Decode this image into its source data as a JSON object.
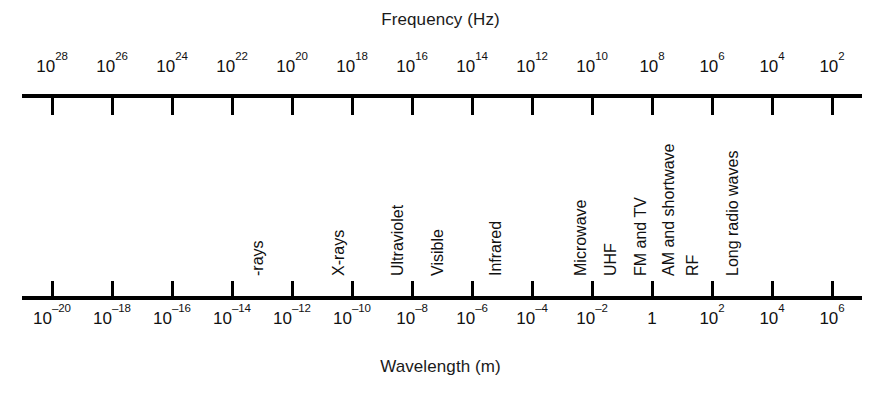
{
  "figure": {
    "name": "electromagnetic-spectrum-chart",
    "top_axis_title": "Frequency (Hz)",
    "bottom_axis_title": "Wavelength (m)",
    "line_color": "#000000",
    "text_color": "#111111",
    "background_color": "#ffffff"
  },
  "chart_data": {
    "type": "line",
    "xlabel": "Wavelength (m)",
    "ylabel": "",
    "top_axis": {
      "label": "Frequency (Hz)",
      "unit": "Hz",
      "direction": "decreasing left-to-right",
      "exponents": [
        28,
        26,
        24,
        22,
        20,
        18,
        16,
        14,
        12,
        10,
        8,
        6,
        4,
        2
      ],
      "tick_labels": [
        "10^28",
        "10^26",
        "10^24",
        "10^22",
        "10^20",
        "10^18",
        "10^16",
        "10^14",
        "10^12",
        "10^10",
        "10^8",
        "10^6",
        "10^4",
        "10^2"
      ]
    },
    "bottom_axis": {
      "label": "Wavelength (m)",
      "unit": "m",
      "direction": "increasing left-to-right",
      "exponents": [
        -20,
        -18,
        -16,
        -14,
        -12,
        -10,
        -8,
        -6,
        -4,
        -2,
        0,
        2,
        4,
        6
      ],
      "tick_labels": [
        "10^-20",
        "10^-18",
        "10^-16",
        "10^-14",
        "10^-12",
        "10^-10",
        "10^-8",
        "10^-6",
        "10^-4",
        "10^-2",
        "1",
        "10^2",
        "10^4",
        "10^6"
      ]
    },
    "bands": [
      {
        "label": "-rays",
        "wavelength_exponent": -16.5
      },
      {
        "label": "X-rays",
        "wavelength_exponent": -10.8
      },
      {
        "label": "Ultraviolet",
        "wavelength_exponent": -8.8
      },
      {
        "label": "Visible",
        "wavelength_exponent": -7.5
      },
      {
        "label": "Infrared",
        "wavelength_exponent": -5.5
      },
      {
        "label": "Microwave",
        "wavelength_exponent": -2.6
      },
      {
        "label": "UHF",
        "wavelength_exponent": -1.6
      },
      {
        "label": "FM and TV",
        "wavelength_exponent": -0.6
      },
      {
        "label": "AM and shortwave",
        "wavelength_exponent": 0.3
      },
      {
        "label": "RF",
        "wavelength_exponent": 1.1
      },
      {
        "label": "Long radio waves",
        "wavelength_exponent": 2.4
      }
    ],
    "grid": false,
    "legend": "none"
  },
  "ticks_top": [
    {
      "label_html": "10<sup>28</sup>",
      "x": 52
    },
    {
      "label_html": "10<sup>26</sup>",
      "x": 112
    },
    {
      "label_html": "10<sup>24</sup>",
      "x": 172
    },
    {
      "label_html": "10<sup>22</sup>",
      "x": 232
    },
    {
      "label_html": "10<sup>20</sup>",
      "x": 292
    },
    {
      "label_html": "10<sup>18</sup>",
      "x": 352
    },
    {
      "label_html": "10<sup>16</sup>",
      "x": 412
    },
    {
      "label_html": "10<sup>14</sup>",
      "x": 472
    },
    {
      "label_html": "10<sup>12</sup>",
      "x": 532
    },
    {
      "label_html": "10<sup>10</sup>",
      "x": 592
    },
    {
      "label_html": "10<sup>8</sup>",
      "x": 652
    },
    {
      "label_html": "10<sup>6</sup>",
      "x": 712
    },
    {
      "label_html": "10<sup>4</sup>",
      "x": 772
    },
    {
      "label_html": "10<sup>2</sup>",
      "x": 832
    }
  ],
  "ticks_bottom": [
    {
      "label_html": "10<sup>&#8211;20</sup>",
      "x": 52
    },
    {
      "label_html": "10<sup>&#8211;18</sup>",
      "x": 112
    },
    {
      "label_html": "10<sup>&#8211;16</sup>",
      "x": 172
    },
    {
      "label_html": "10<sup>&#8211;14</sup>",
      "x": 232
    },
    {
      "label_html": "10<sup>&#8211;12</sup>",
      "x": 292
    },
    {
      "label_html": "10<sup>&#8211;10</sup>",
      "x": 352
    },
    {
      "label_html": "10<sup>&#8211;8</sup>",
      "x": 412
    },
    {
      "label_html": "10<sup>&#8211;6</sup>",
      "x": 472
    },
    {
      "label_html": "10<sup>&#8211;4</sup>",
      "x": 532
    },
    {
      "label_html": "10<sup>&#8211;2</sup>",
      "x": 592
    },
    {
      "label_html": "1",
      "x": 652
    },
    {
      "label_html": "10<sup>2</sup>",
      "x": 712
    },
    {
      "label_html": "10<sup>4</sup>",
      "x": 772
    },
    {
      "label_html": "10<sup>6</sup>",
      "x": 832
    }
  ],
  "band_labels": [
    {
      "name": "band-label-gamma-rays",
      "text": "-rays",
      "x": 266
    },
    {
      "name": "band-label-x-rays",
      "text": "X-rays",
      "x": 347
    },
    {
      "name": "band-label-ultraviolet",
      "text": "Ultraviolet",
      "x": 406
    },
    {
      "name": "band-label-visible",
      "text": "Visible",
      "x": 446
    },
    {
      "name": "band-label-infrared",
      "text": "Infrared",
      "x": 504
    },
    {
      "name": "band-label-microwave",
      "text": "Microwave",
      "x": 589
    },
    {
      "name": "band-label-uhf",
      "text": "UHF",
      "x": 619
    },
    {
      "name": "band-label-fm-and-tv",
      "text": "FM and TV",
      "x": 649
    },
    {
      "name": "band-label-am-and-shortwave",
      "text": "AM and shortwave",
      "x": 677
    },
    {
      "name": "band-label-rf",
      "text": "RF",
      "x": 701
    },
    {
      "name": "band-label-long-radio-waves",
      "text": "Long radio waves",
      "x": 741
    }
  ]
}
